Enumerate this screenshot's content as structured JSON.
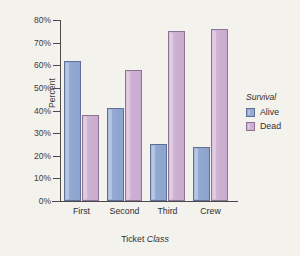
{
  "chart_data": {
    "type": "bar",
    "title": "",
    "xlabel": "Ticket Class",
    "xlabel_plain": "Ticket",
    "xlabel_italic": "Class",
    "ylabel": "Percent",
    "categories": [
      "First",
      "Second",
      "Third",
      "Crew"
    ],
    "series": [
      {
        "name": "Alive",
        "values": [
          62,
          41,
          25,
          24
        ],
        "color": "#93a9d2"
      },
      {
        "name": "Dead",
        "values": [
          38,
          58,
          75,
          76
        ],
        "color": "#cdb0d2"
      }
    ],
    "legend": {
      "title": "Survival",
      "position": "right",
      "entries": [
        "Alive",
        "Dead"
      ]
    },
    "ylim": [
      0,
      80
    ],
    "ytick_values": [
      0,
      10,
      20,
      30,
      40,
      50,
      60,
      70,
      80
    ],
    "ytick_labels": [
      "0%",
      "10%",
      "20%",
      "30%",
      "40%",
      "50%",
      "60%",
      "70%",
      "80%"
    ],
    "grid": false,
    "background_color": "#f3f2ed"
  }
}
